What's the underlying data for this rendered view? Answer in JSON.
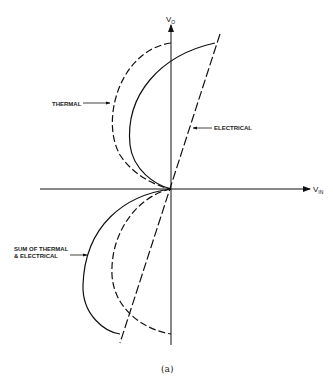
{
  "figure": {
    "caption": "(a)",
    "axes": {
      "y_label_main": "V",
      "y_label_sub": "O",
      "x_label_main": "V",
      "x_label_sub": "IN"
    },
    "curves": [
      {
        "name": "THERMAL",
        "style": "dashed",
        "label": "THERMAL"
      },
      {
        "name": "ELECTRICAL",
        "style": "dashed",
        "label": "ELECTRICAL"
      },
      {
        "name": "SUM",
        "style": "solid",
        "label_line1": "SUM OF THERMAL",
        "label_line2": "& ELECTRICAL"
      }
    ]
  }
}
